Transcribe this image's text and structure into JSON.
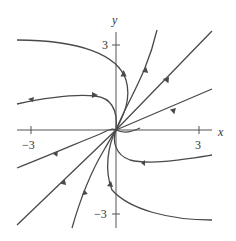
{
  "figure": {
    "type": "phase-portrait",
    "axes": {
      "x_label": "x",
      "y_label": "y",
      "x_ticks": [
        {
          "value": -3,
          "label": "−3"
        },
        {
          "value": 3,
          "label": "3"
        }
      ],
      "y_ticks": [
        {
          "value": 3,
          "label": "3"
        },
        {
          "value": -3,
          "label": "−3"
        }
      ],
      "range": {
        "x": [
          -3.5,
          3.5
        ],
        "y": [
          -3.5,
          3.5
        ]
      }
    },
    "equilibrium": {
      "x": 0,
      "y": 0,
      "kind": "nodal source/sink (all trajectories approach origin)"
    },
    "trajectory_count": 10,
    "colors": {
      "curve": "#4a4a4a",
      "axis": "#555555",
      "background": "#ffffff"
    }
  }
}
